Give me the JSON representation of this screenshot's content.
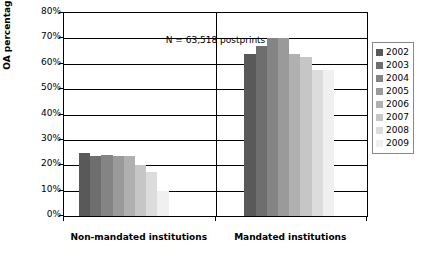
{
  "chart_data": {
    "type": "bar",
    "title": "",
    "subtitle": "",
    "xlabel": "",
    "ylabel": "OA percentage",
    "ylim": [
      0,
      80
    ],
    "ytick_labels": [
      "80%",
      "70%",
      "60%",
      "50%",
      "40%",
      "30%",
      "20%",
      "10%",
      "0%"
    ],
    "ytick_values": [
      80,
      70,
      60,
      50,
      40,
      30,
      20,
      10,
      0
    ],
    "grid": true,
    "grid_axis": "y",
    "legend_position": "right",
    "annotations": [
      {
        "text": "N = 63,518 postprints",
        "position": "top-center"
      }
    ],
    "categories": [
      "Non-mandated institutions",
      "Mandated institutions"
    ],
    "series": [
      {
        "name": "2002",
        "color": "#595959",
        "values": [
          25.0,
          64.0
        ]
      },
      {
        "name": "2003",
        "color": "#6e6e6e",
        "values": [
          23.5,
          67.0
        ]
      },
      {
        "name": "2004",
        "color": "#848484",
        "values": [
          24.0,
          70.0
        ]
      },
      {
        "name": "2005",
        "color": "#9a9a9a",
        "values": [
          23.5,
          70.0
        ]
      },
      {
        "name": "2006",
        "color": "#b0b0b0",
        "values": [
          23.5,
          64.0
        ]
      },
      {
        "name": "2007",
        "color": "#c6c6c6",
        "values": [
          20.0,
          62.5
        ]
      },
      {
        "name": "2008",
        "color": "#dcdcdc",
        "values": [
          17.5,
          57.5
        ]
      },
      {
        "name": "2009",
        "color": "#f0f0f0",
        "values": [
          10.0,
          57.5
        ]
      }
    ]
  },
  "legend": {
    "items": [
      {
        "label": "2002",
        "color": "#595959"
      },
      {
        "label": "2003",
        "color": "#6e6e6e"
      },
      {
        "label": "2004",
        "color": "#848484"
      },
      {
        "label": "2005",
        "color": "#9a9a9a"
      },
      {
        "label": "2006",
        "color": "#b0b0b0"
      },
      {
        "label": "2007",
        "color": "#c6c6c6"
      },
      {
        "label": "2008",
        "color": "#dcdcdc"
      },
      {
        "label": "2009",
        "color": "#f0f0f0"
      }
    ]
  }
}
